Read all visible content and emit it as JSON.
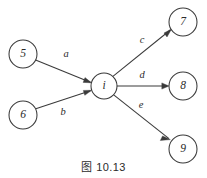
{
  "figure": {
    "caption": "图 10.13",
    "background_color": "#ffffff",
    "stroke_color": "#3a3a3a",
    "text_color": "#2b2b2b"
  },
  "diagram_data": {
    "type": "directed-graph",
    "description": "Star-shaped directed graph: two source nodes flow into center node i, which flows out to three sink nodes.",
    "nodes": [
      {
        "id": "n5",
        "label": "5",
        "cx": 23,
        "cy": 54,
        "r": 14,
        "role": "source"
      },
      {
        "id": "n6",
        "label": "6",
        "cx": 23,
        "cy": 115,
        "r": 14,
        "role": "source"
      },
      {
        "id": "ni",
        "label": "i",
        "cx": 104,
        "cy": 86,
        "r": 13,
        "role": "center"
      },
      {
        "id": "n7",
        "label": "7",
        "cx": 183,
        "cy": 22,
        "r": 14,
        "role": "sink"
      },
      {
        "id": "n8",
        "label": "8",
        "cx": 183,
        "cy": 86,
        "r": 14,
        "role": "sink"
      },
      {
        "id": "n9",
        "label": "9",
        "cx": 183,
        "cy": 149,
        "r": 14,
        "role": "sink"
      }
    ],
    "edges": [
      {
        "id": "ea",
        "label": "a",
        "from": "n5",
        "to": "ni",
        "label_x": 66,
        "label_y": 55,
        "direction": "in"
      },
      {
        "id": "eb",
        "label": "b",
        "from": "n6",
        "to": "ni",
        "label_x": 63,
        "label_y": 113,
        "direction": "in"
      },
      {
        "id": "ec",
        "label": "c",
        "from": "ni",
        "to": "n7",
        "label_x": 142,
        "label_y": 41,
        "direction": "out"
      },
      {
        "id": "ed",
        "label": "d",
        "from": "ni",
        "to": "n8",
        "label_x": 142,
        "label_y": 76,
        "direction": "out"
      },
      {
        "id": "ee",
        "label": "e",
        "from": "ni",
        "to": "n9",
        "label_x": 141,
        "label_y": 106,
        "direction": "out"
      }
    ]
  }
}
